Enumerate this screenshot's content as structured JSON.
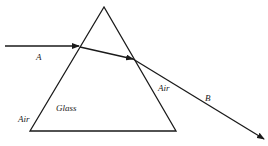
{
  "diagram": {
    "labels": {
      "ray_in": "A",
      "ray_out": "B",
      "medium_inside": "Glass",
      "medium_left": "Air",
      "medium_right": "Air"
    },
    "colors": {
      "line": "#1a1a1a",
      "background": "#ffffff"
    }
  }
}
